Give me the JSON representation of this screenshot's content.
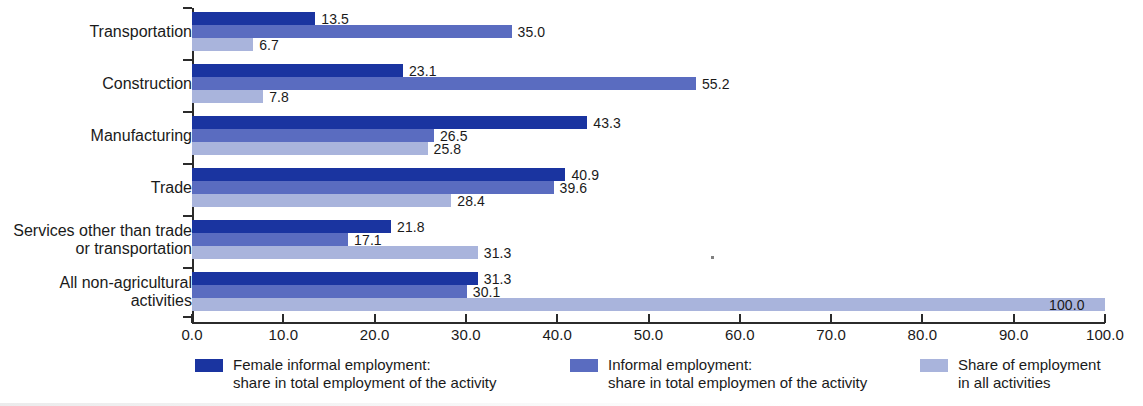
{
  "chart_data": {
    "type": "bar",
    "orientation": "horizontal",
    "title": "",
    "subtitle": "",
    "xlabel": "",
    "ylabel": "",
    "xlim": [
      0.0,
      100.0
    ],
    "xticks": [
      "0.0",
      "10.0",
      "20.0",
      "30.0",
      "40.0",
      "50.0",
      "60.0",
      "70.0",
      "80.0",
      "90.0",
      "100.0"
    ],
    "xtick_values": [
      0,
      10,
      20,
      30,
      40,
      50,
      60,
      70,
      80,
      90,
      100
    ],
    "grid": false,
    "legend_position": "bottom",
    "categories": [
      "Transportation",
      "Construction",
      "Manufacturing",
      "Trade",
      "Services other than trade\nor transportation",
      "All non-agricultural\nactivities"
    ],
    "series": [
      {
        "name": "Female informal employment:\nshare in total employment of the activity",
        "color": "#1a34a0",
        "values": [
          13.5,
          23.1,
          43.3,
          40.9,
          21.8,
          31.3
        ],
        "labels": [
          "13.5",
          "23.1",
          "43.3",
          "40.9",
          "21.8",
          "31.3"
        ]
      },
      {
        "name": "Informal employment:\nshare in total employmen of the activity",
        "color": "#5a6cc0",
        "values": [
          35.0,
          55.2,
          26.5,
          39.6,
          17.1,
          30.1
        ],
        "labels": [
          "35.0",
          "55.2",
          "26.5",
          "39.6",
          "17.1",
          "30.1"
        ]
      },
      {
        "name": "Share of employment\nin all activities",
        "color": "#a9b4dc",
        "values": [
          6.7,
          7.8,
          25.8,
          28.4,
          31.3,
          100.0
        ],
        "labels": [
          "6.7",
          "7.8",
          "25.8",
          "28.4",
          "31.3",
          "100.0"
        ]
      }
    ]
  },
  "legend": {
    "items": [
      {
        "label": "Female informal employment:\nshare in total employment of the activity",
        "color": "#1a34a0"
      },
      {
        "label": "Informal employment:\nshare in total employmen of the activity",
        "color": "#5a6cc0"
      },
      {
        "label": "Share of employment\nin all activities",
        "color": "#a9b4dc"
      }
    ]
  }
}
